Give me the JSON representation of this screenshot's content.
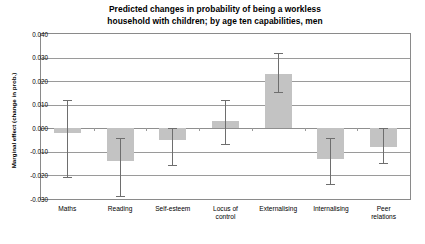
{
  "chart_data": {
    "type": "bar",
    "title": "Predicted changes in probability of being a workless household with children; by age ten capabilities, men",
    "title_line1": "Predicted changes in probability of being a workless",
    "title_line2": "household with children; by age ten capabilities, men",
    "xlabel": "",
    "ylabel": "Marginal effect (change in prob.)",
    "ylim": [
      -0.03,
      0.04
    ],
    "ytick_step": 0.01,
    "ytick_labels": [
      "0.040",
      "0.030",
      "0.020",
      "0.010",
      "0.000",
      "-0.010",
      "-0.020",
      "-0.030"
    ],
    "ytick_values": [
      0.04,
      0.03,
      0.02,
      0.01,
      0.0,
      -0.01,
      -0.02,
      -0.03
    ],
    "grid": true,
    "legend": "none",
    "bar_color": "#c3c3c3",
    "errorbar_color": "#6e6e6e",
    "gridline_color": "#9a9a9a",
    "categories": [
      "Maths",
      "Reading",
      "Self-esteem",
      "Locus of control",
      "Externalising",
      "Internalising",
      "Peer relations"
    ],
    "category_label_lines": [
      [
        "Maths"
      ],
      [
        "Reading"
      ],
      [
        "Self-esteem"
      ],
      [
        "Locus of",
        "control"
      ],
      [
        "Externalising"
      ],
      [
        "Internalising"
      ],
      [
        "Peer",
        "relations"
      ]
    ],
    "values": [
      -0.002,
      -0.014,
      -0.005,
      0.003,
      0.023,
      -0.013,
      -0.008
    ],
    "error_low": [
      -0.021,
      -0.029,
      -0.016,
      -0.007,
      0.015,
      -0.024,
      -0.015
    ],
    "error_high": [
      0.012,
      -0.004,
      0.0,
      0.012,
      0.032,
      -0.004,
      0.0
    ],
    "series": [
      {
        "name": "Marginal effect",
        "values": [
          -0.002,
          -0.014,
          -0.005,
          0.003,
          0.023,
          -0.013,
          -0.008
        ]
      }
    ]
  }
}
